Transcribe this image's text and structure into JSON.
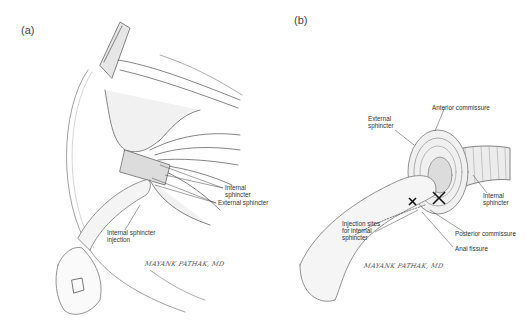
{
  "figure": {
    "panels": [
      {
        "id": "a",
        "label": "(a)",
        "annotations": {
          "internal_sphincter": "Internal sphincter",
          "external_sphincter": "External sphincter",
          "injection": "Internal sphincter\ninjection"
        },
        "signature": "MAYANK PATHAK, MD"
      },
      {
        "id": "b",
        "label": "(b)",
        "annotations": {
          "anterior_commissure": "Anterior commissure",
          "external_sphincter": "External\nsphincter",
          "internal_sphincter": "Internal\nsphincter",
          "injection_sites": "Injection sites\nfor internal\nsphincter",
          "posterior_commissure": "Posterior commissure",
          "anal_fissure": "Anal fissure"
        },
        "signature": "MAYANK PATHAK, MD"
      }
    ],
    "colors": {
      "ink": "#555555",
      "background": "#ffffff",
      "shade": "#cfcfcf"
    }
  }
}
